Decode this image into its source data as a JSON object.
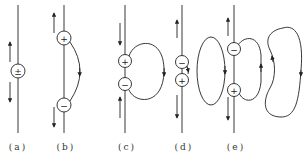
{
  "figure": {
    "panels": [
      {
        "id": "a",
        "label": "(a)",
        "charges": [
          "±"
        ],
        "description": "single dipole at center of straight wire, currents outward"
      },
      {
        "id": "b",
        "label": "(b)",
        "charges": [
          "+",
          "−"
        ],
        "description": "separated charges with curved current path between them"
      },
      {
        "id": "c",
        "label": "(c)",
        "charges": [
          "+",
          "−"
        ],
        "description": "charges close together with closed loop on right"
      },
      {
        "id": "d",
        "label": "(d)",
        "charges": [
          "−",
          "+"
        ],
        "description": "reversed charges with detached elliptical loop"
      },
      {
        "id": "e",
        "label": "(e)",
        "charges": [
          "−",
          "+"
        ],
        "description": "charges with loop plus detached kidney-shaped loop"
      }
    ],
    "colors": {
      "stroke": "#222222",
      "background": "#ffffff"
    }
  }
}
